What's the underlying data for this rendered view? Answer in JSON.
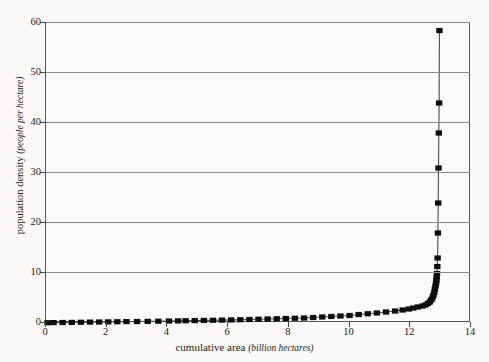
{
  "chart_data": {
    "type": "scatter",
    "title": "",
    "xlabel": "cumulative area",
    "xunit": "(billion hectares)",
    "ylabel": "population density",
    "yunit": "(people per hectare)",
    "xlim": [
      0,
      14
    ],
    "ylim": [
      0,
      60
    ],
    "xticks": [
      0,
      2,
      4,
      6,
      8,
      10,
      12,
      14
    ],
    "yticks": [
      0,
      10,
      20,
      30,
      40,
      50,
      60
    ],
    "grid": "horizontal",
    "legend": "none",
    "marker": "filled-square",
    "marker_color": "#0d0d0d",
    "line_color": "#4a4a4a",
    "series": [
      {
        "name": "population density by cumulative area",
        "x": [
          0.05,
          0.25,
          0.55,
          0.85,
          1.15,
          1.45,
          1.75,
          2.05,
          2.35,
          2.65,
          3.0,
          3.35,
          3.7,
          4.05,
          4.35,
          4.6,
          4.9,
          5.2,
          5.5,
          5.8,
          6.1,
          6.4,
          6.7,
          7.0,
          7.3,
          7.6,
          7.9,
          8.2,
          8.5,
          8.8,
          9.1,
          9.4,
          9.7,
          10.0,
          10.3,
          10.6,
          10.9,
          11.2,
          11.5,
          11.75,
          11.95,
          12.1,
          12.25,
          12.4,
          12.5,
          12.58,
          12.64,
          12.69,
          12.73,
          12.76,
          12.79,
          12.81,
          12.83,
          12.85,
          12.86,
          12.87,
          12.88,
          12.89,
          12.9,
          12.91,
          12.92,
          12.93,
          12.94,
          12.95,
          12.96
        ],
        "y": [
          0.05,
          0.08,
          0.1,
          0.12,
          0.15,
          0.18,
          0.2,
          0.22,
          0.25,
          0.28,
          0.3,
          0.33,
          0.36,
          0.4,
          0.42,
          0.45,
          0.48,
          0.52,
          0.55,
          0.58,
          0.62,
          0.66,
          0.7,
          0.75,
          0.8,
          0.85,
          0.9,
          0.95,
          1.0,
          1.1,
          1.2,
          1.3,
          1.4,
          1.5,
          1.7,
          1.85,
          2.0,
          2.2,
          2.4,
          2.6,
          2.8,
          3.0,
          3.2,
          3.4,
          3.6,
          3.9,
          4.2,
          4.6,
          5.0,
          5.5,
          6.1,
          6.8,
          7.4,
          8.0,
          8.6,
          9.2,
          9.9,
          11.3,
          13.0,
          18.0,
          24.0,
          31.0,
          38.0,
          44.0,
          58.5
        ]
      }
    ]
  }
}
